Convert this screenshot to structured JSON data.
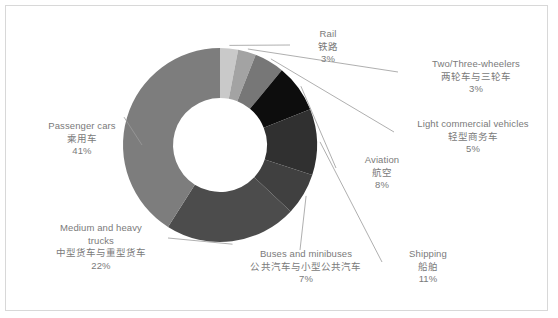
{
  "chart_data": {
    "type": "pie",
    "variant": "donut",
    "title": "",
    "subtitle": "",
    "xlabel": "",
    "ylabel": "",
    "grid": false,
    "legend_position": "none",
    "label_format": "percent",
    "start_angle_deg": 0,
    "direction": "clockwise",
    "center": [
      220,
      145
    ],
    "outer_radius": 97,
    "inner_radius": 47,
    "categories": [
      "Rail",
      "Two/Three-wheelers",
      "Light commercial vehicles",
      "Aviation",
      "Shipping",
      "Buses and minibuses",
      "Medium and heavy trucks",
      "Passenger cars"
    ],
    "categories_cn": [
      "铁路",
      "两轮车与三轮车",
      "轻型商务车",
      "航空",
      "船舶",
      "公共汽车与小型公共汽车",
      "中型货车与重型货车",
      "乘用车"
    ],
    "values": [
      3,
      3,
      5,
      8,
      11,
      7,
      22,
      41
    ],
    "value_labels": [
      "3%",
      "3%",
      "5%",
      "8%",
      "11%",
      "7%",
      "22%",
      "41%"
    ],
    "colors": [
      "#c9c9c9",
      "#a3a3a3",
      "#777777",
      "#0d0d0d",
      "#303030",
      "#404040",
      "#4c4c4c",
      "#7d7d7d"
    ],
    "total": 100
  },
  "frame": {
    "border_color": "#d8d8d8",
    "background": "#ffffff"
  },
  "leader_line_color": "#9a9a9a",
  "labels": {
    "passenger_cars": {
      "en": "Passenger cars",
      "cn": "乘用车",
      "pct": "41%"
    },
    "medium_heavy_trucks": {
      "en1": "Medium and heavy",
      "en2": "trucks",
      "cn": "中型货车与重型货车",
      "pct": "22%"
    },
    "buses": {
      "en": "Buses and minibuses",
      "cn": "公共汽车与小型公共汽车",
      "pct": "7%"
    },
    "shipping": {
      "en": "Shipping",
      "cn": "船舶",
      "pct": "11%"
    },
    "aviation": {
      "en": "Aviation",
      "cn": "航空",
      "pct": "8%"
    },
    "light_commercial": {
      "en": "Light commercial vehicles",
      "cn": "轻型商务车",
      "pct": "5%"
    },
    "two_three_wheelers": {
      "en": "Two/Three-wheelers",
      "cn": "两轮车与三轮车",
      "pct": "3%"
    },
    "rail": {
      "en": "Rail",
      "cn": "铁路",
      "pct": "3%"
    }
  }
}
